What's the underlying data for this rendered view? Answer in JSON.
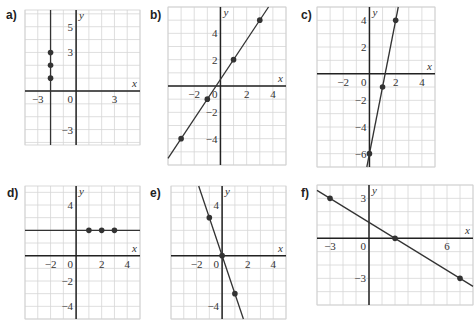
{
  "chart_data": [
    {
      "id": "a",
      "label": "a)",
      "type": "line",
      "box": {
        "left": 25,
        "top": 10,
        "width": 115,
        "height": 135
      },
      "xrange": [
        -4,
        5
      ],
      "yrange": [
        -4.2,
        6.3
      ],
      "xlabel": "x",
      "ylabel": "y",
      "xticks": [
        {
          "v": -3,
          "t": "−3"
        },
        {
          "v": 3,
          "t": "3"
        }
      ],
      "yticks": [
        {
          "v": 5,
          "t": "5"
        },
        {
          "v": 3,
          "t": "3"
        },
        {
          "v": -3,
          "t": "−3"
        }
      ],
      "origin_label": "0",
      "line": {
        "kind": "vertical",
        "x": -2
      },
      "points": [
        [
          -2,
          1
        ],
        [
          -2,
          2
        ],
        [
          -2,
          3
        ]
      ]
    },
    {
      "id": "b",
      "label": "b)",
      "type": "line",
      "box": {
        "left": 168,
        "top": 7,
        "width": 118,
        "height": 158
      },
      "xrange": [
        -4,
        5
      ],
      "yrange": [
        -6,
        6
      ],
      "xlabel": "x",
      "ylabel": "y",
      "xticks": [
        {
          "v": -2,
          "t": "−2"
        },
        {
          "v": 2,
          "t": "2"
        },
        {
          "v": 4,
          "t": "4"
        }
      ],
      "yticks": [
        {
          "v": 4,
          "t": "4"
        },
        {
          "v": 2,
          "t": "2"
        },
        {
          "v": -2,
          "t": "−2"
        },
        {
          "v": -4,
          "t": "−4"
        }
      ],
      "origin_label": "0",
      "line": {
        "kind": "slope",
        "m": 1.5,
        "b": 0.5
      },
      "points": [
        [
          -3,
          -4
        ],
        [
          -1,
          -1
        ],
        [
          1,
          2
        ],
        [
          3,
          5
        ]
      ]
    },
    {
      "id": "c",
      "label": "c)",
      "type": "line",
      "box": {
        "left": 317,
        "top": 7,
        "width": 118,
        "height": 160
      },
      "xrange": [
        -4,
        5
      ],
      "yrange": [
        -7,
        5
      ],
      "xlabel": "x",
      "ylabel": "y",
      "xticks": [
        {
          "v": -2,
          "t": "−2"
        },
        {
          "v": 2,
          "t": "2"
        },
        {
          "v": 4,
          "t": "4"
        }
      ],
      "yticks": [
        {
          "v": 4,
          "t": "4"
        },
        {
          "v": 2,
          "t": "2"
        },
        {
          "v": -2,
          "t": "−2"
        },
        {
          "v": -4,
          "t": "−4"
        },
        {
          "v": -6,
          "t": "−6"
        }
      ],
      "origin_label": "0",
      "line": {
        "kind": "slope",
        "m": 5,
        "b": -6
      },
      "points": [
        [
          0,
          -6
        ],
        [
          1,
          -1
        ],
        [
          2,
          4
        ]
      ]
    },
    {
      "id": "d",
      "label": "d)",
      "type": "line",
      "box": {
        "left": 25,
        "top": 186,
        "width": 115,
        "height": 133
      },
      "xrange": [
        -4,
        5
      ],
      "yrange": [
        -5,
        5.5
      ],
      "xlabel": "x",
      "ylabel": "y",
      "xticks": [
        {
          "v": -2,
          "t": "−2"
        },
        {
          "v": 2,
          "t": "2"
        },
        {
          "v": 4,
          "t": "4"
        }
      ],
      "yticks": [
        {
          "v": 4,
          "t": "4"
        },
        {
          "v": -2,
          "t": "−2"
        },
        {
          "v": -4,
          "t": "−4"
        }
      ],
      "origin_label": "0",
      "line": {
        "kind": "slope",
        "m": 0,
        "b": 2
      },
      "points": [
        [
          1,
          2
        ],
        [
          2,
          2
        ],
        [
          3,
          2
        ]
      ]
    },
    {
      "id": "e",
      "label": "e)",
      "type": "line",
      "box": {
        "left": 171,
        "top": 186,
        "width": 115,
        "height": 133
      },
      "xrange": [
        -4,
        5
      ],
      "yrange": [
        -5,
        5.5
      ],
      "xlabel": "x",
      "ylabel": "y",
      "xticks": [
        {
          "v": -2,
          "t": "−2"
        },
        {
          "v": 2,
          "t": "2"
        },
        {
          "v": 4,
          "t": "4"
        }
      ],
      "yticks": [
        {
          "v": 4,
          "t": "4"
        },
        {
          "v": -4,
          "t": "−4"
        }
      ],
      "origin_label": "0",
      "line": {
        "kind": "slope",
        "m": -3,
        "b": 0
      },
      "points": [
        [
          -1,
          3
        ],
        [
          0,
          0
        ],
        [
          1,
          -3
        ]
      ]
    },
    {
      "id": "f",
      "label": "f)",
      "type": "line",
      "box": {
        "left": 317,
        "top": 185,
        "width": 156,
        "height": 120
      },
      "xrange": [
        -4,
        8
      ],
      "yrange": [
        -5,
        4
      ],
      "xlabel": "x",
      "ylabel": "y",
      "xticks": [
        {
          "v": -3,
          "t": "−3"
        },
        {
          "v": 6,
          "t": "6"
        }
      ],
      "yticks": [
        {
          "v": 3,
          "t": "3"
        },
        {
          "v": -3,
          "t": "−3"
        }
      ],
      "origin_label": "0",
      "line": {
        "kind": "slope",
        "m": -0.6,
        "b": 1.2
      },
      "points": [
        [
          -3,
          3
        ],
        [
          2,
          0
        ],
        [
          7,
          -3
        ]
      ]
    }
  ],
  "labels": {
    "a": "a)",
    "b": "b)",
    "c": "c)",
    "d": "d)",
    "e": "e)",
    "f": "f)"
  }
}
